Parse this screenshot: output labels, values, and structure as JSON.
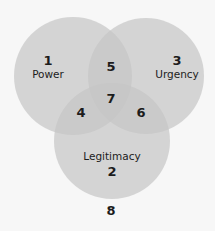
{
  "diagram": {
    "type": "venn",
    "colors": {
      "background": "#f7f7f7",
      "circle_fill": "#a8a8a8",
      "text": "#1c1c1c"
    },
    "circles": [
      {
        "id": "power",
        "label": "Power",
        "number": "1"
      },
      {
        "id": "urgency",
        "label": "Urgency",
        "number": "3"
      },
      {
        "id": "legitimacy",
        "label": "Legitimacy",
        "number": "2"
      }
    ],
    "regions": [
      {
        "number": "4",
        "sets": [
          "Power",
          "Legitimacy"
        ]
      },
      {
        "number": "5",
        "sets": [
          "Power",
          "Urgency"
        ]
      },
      {
        "number": "6",
        "sets": [
          "Urgency",
          "Legitimacy"
        ]
      },
      {
        "number": "7",
        "sets": [
          "Power",
          "Urgency",
          "Legitimacy"
        ]
      }
    ],
    "outside": {
      "number": "8"
    }
  }
}
